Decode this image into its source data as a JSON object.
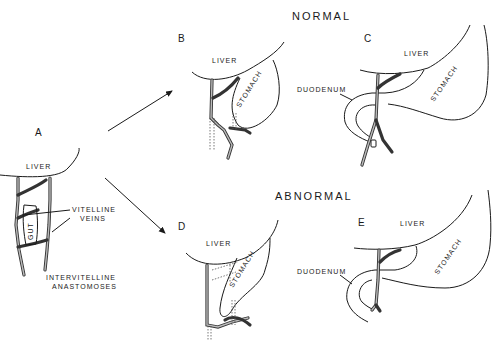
{
  "headings": {
    "normal": "NORMAL",
    "abnormal": "ABNORMAL"
  },
  "panels": {
    "A": {
      "letter": "A",
      "liver": "LIVER",
      "gut": "GUT",
      "vitelline": [
        "VITELLINE",
        "VEINS"
      ],
      "anastomoses": [
        "INTERVITELLINE",
        "ANASTOMOSES"
      ]
    },
    "B": {
      "letter": "B",
      "liver": "LIVER",
      "stomach": "STOMACH"
    },
    "C": {
      "letter": "C",
      "liver": "LIVER",
      "stomach": "STOMACH",
      "duodenum": "DUODENUM"
    },
    "D": {
      "letter": "D",
      "liver": "LIVER",
      "stomach": "STOMACH"
    },
    "E": {
      "letter": "E",
      "liver": "LIVER",
      "stomach": "STOMACH",
      "duodenum": "DUODENUM"
    }
  },
  "arrows": [
    {
      "from": "A",
      "to": "B"
    },
    {
      "from": "A",
      "to": "D"
    }
  ]
}
